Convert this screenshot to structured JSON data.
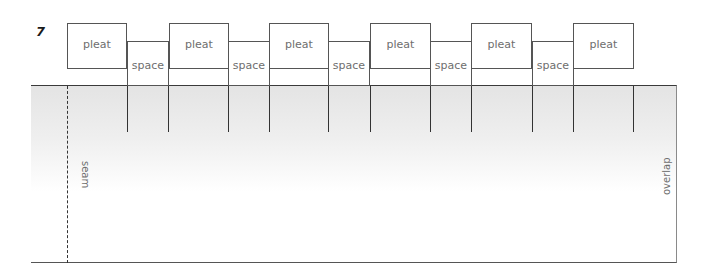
{
  "figure": {
    "step_number": "7",
    "pleat_label": "pleat",
    "space_label": "space",
    "seam_label": "seam",
    "overlap_label": "overlap",
    "sequence": [
      "pleat",
      "space",
      "pleat",
      "space",
      "pleat",
      "space",
      "pleat",
      "space",
      "pleat",
      "space",
      "pleat"
    ],
    "pleats": [
      {
        "label": "pleat",
        "x": 67,
        "w": 60
      },
      {
        "label": "pleat",
        "x": 169,
        "w": 60
      },
      {
        "label": "pleat",
        "x": 269,
        "w": 60
      },
      {
        "label": "pleat",
        "x": 370,
        "w": 61
      },
      {
        "label": "pleat",
        "x": 471,
        "w": 61
      },
      {
        "label": "pleat",
        "x": 573,
        "w": 61
      }
    ],
    "spaces": [
      {
        "label": "space",
        "x": 127,
        "w": 42
      },
      {
        "label": "space",
        "x": 228,
        "w": 42
      },
      {
        "label": "space",
        "x": 328,
        "w": 42
      },
      {
        "label": "space",
        "x": 430,
        "w": 42
      },
      {
        "label": "space",
        "x": 532,
        "w": 42
      }
    ],
    "fold_lines_x": [
      127,
      168,
      228,
      269,
      328,
      370,
      430,
      471,
      532,
      573,
      633
    ],
    "colors": {
      "outline": "#555555",
      "text": "#6e6e6e",
      "fabric_top": "#e4e4e4",
      "fabric_bottom": "#ffffff"
    }
  }
}
